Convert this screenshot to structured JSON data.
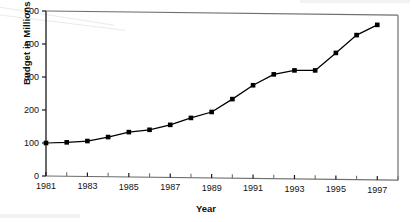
{
  "chart_data": {
    "type": "line",
    "title": "",
    "xlabel": "Year",
    "ylabel": "Budget in Millions of Dollars",
    "xlim": [
      1981,
      1998
    ],
    "ylim": [
      0,
      500
    ],
    "grid": false,
    "legend": false,
    "marker": "square",
    "marker_color": "#000000",
    "line_color": "#000000",
    "x": [
      1981,
      1982,
      1983,
      1984,
      1985,
      1986,
      1987,
      1988,
      1989,
      1990,
      1991,
      1992,
      1993,
      1994,
      1995,
      1996,
      1997
    ],
    "values": [
      100,
      102,
      106,
      118,
      133,
      140,
      155,
      176,
      194,
      233,
      275,
      308,
      320,
      320,
      373,
      427,
      458
    ],
    "ytick_labels": [
      "0",
      "100",
      "200",
      "300",
      "400",
      "500"
    ],
    "ytick_values": [
      0,
      100,
      200,
      300,
      400,
      500
    ],
    "xtick_labels": [
      "1981",
      "1983",
      "1985",
      "1987",
      "1989",
      "1991",
      "1993",
      "1995",
      "1997"
    ],
    "xtick_values": [
      1981,
      1983,
      1985,
      1987,
      1989,
      1991,
      1993,
      1995,
      1997
    ],
    "xminor_values": [
      1982,
      1984,
      1986,
      1988,
      1990,
      1992,
      1994,
      1996,
      1998
    ]
  }
}
